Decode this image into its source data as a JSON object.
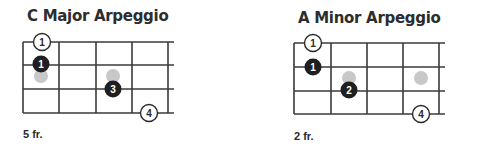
{
  "diagrams": [
    {
      "title": "C Major Arpeggio",
      "fret_label": "5 fr.",
      "strings": 4,
      "frets": 4,
      "markers": [
        {
          "type": "open",
          "label": "1",
          "string": 1,
          "fret": 1
        },
        {
          "type": "filled",
          "label": "1",
          "string": 2,
          "fret": 1
        },
        {
          "type": "ghost",
          "label": "",
          "string": 2.5,
          "fret": 1
        },
        {
          "type": "ghost",
          "label": "",
          "string": 2.5,
          "fret": 3
        },
        {
          "type": "filled",
          "label": "3",
          "string": 3,
          "fret": 3
        },
        {
          "type": "open",
          "label": "4",
          "string": 4,
          "fret": 4
        }
      ]
    },
    {
      "title": "A Minor Arpeggio",
      "fret_label": "2 fr.",
      "strings": 4,
      "frets": 4,
      "markers": [
        {
          "type": "open",
          "label": "1",
          "string": 1,
          "fret": 1
        },
        {
          "type": "filled",
          "label": "1",
          "string": 2,
          "fret": 1
        },
        {
          "type": "ghost",
          "label": "",
          "string": 2.5,
          "fret": 2
        },
        {
          "type": "filled",
          "label": "2",
          "string": 3,
          "fret": 2
        },
        {
          "type": "ghost",
          "label": "",
          "string": 2.5,
          "fret": 4
        },
        {
          "type": "open",
          "label": "4",
          "string": 4,
          "fret": 4
        }
      ]
    }
  ],
  "colors": {
    "line": "#3a3a3a",
    "filled_dot": "#1f1f1f",
    "ghost_dot": "#c8c8c8",
    "open_dot_fill": "#ffffff"
  }
}
